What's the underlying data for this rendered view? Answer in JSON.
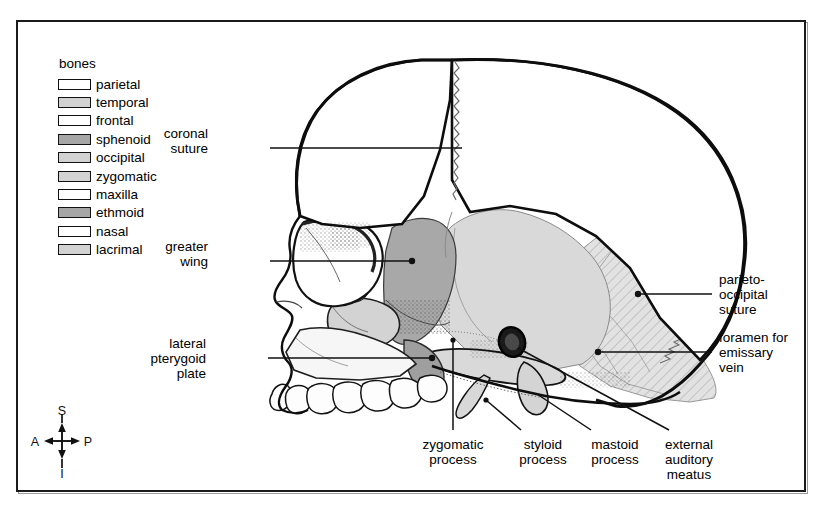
{
  "figure": {
    "frame": {
      "border_color": "#1b1b1b"
    }
  },
  "legend": {
    "title": "bones",
    "items": [
      {
        "label": "parietal",
        "fill": "#ffffff",
        "swatch": "white"
      },
      {
        "label": "temporal",
        "fill": "#d2d2d2",
        "swatch": "light"
      },
      {
        "label": "frontal",
        "fill": "#ffffff",
        "swatch": "white"
      },
      {
        "label": "sphenoid",
        "fill": "#a6a6a6",
        "swatch": "dark"
      },
      {
        "label": "occipital",
        "fill": "#d2d2d2",
        "swatch": "light"
      },
      {
        "label": "zygomatic",
        "fill": "#d2d2d2",
        "swatch": "light"
      },
      {
        "label": "maxilla",
        "fill": "#ffffff",
        "swatch": "white"
      },
      {
        "label": "ethmoid",
        "fill": "#a6a6a6",
        "swatch": "dark"
      },
      {
        "label": "nasal",
        "fill": "#ffffff",
        "swatch": "white"
      },
      {
        "label": "lacrimal",
        "fill": "#d2d2d2",
        "swatch": "light"
      }
    ]
  },
  "compass": {
    "superior": "S",
    "inferior": "I",
    "anterior": "A",
    "posterior": "P"
  },
  "callouts": {
    "coronal_suture": {
      "line1": "coronal",
      "line2": "suture",
      "line3": ""
    },
    "greater_wing": {
      "line1": "greater",
      "line2": "wing",
      "line3": ""
    },
    "lateral_pterygoid": {
      "line1": "lateral",
      "line2": "pterygoid",
      "line3": "plate"
    },
    "parieto_occipital": {
      "line1": "parieto-",
      "line2": "occipital",
      "line3": "suture"
    },
    "foramen_emissary": {
      "line1": "foramen for",
      "line2": "emissary",
      "line3": "vein"
    },
    "zygomatic_process": {
      "line1": "zygomatic",
      "line2": "process",
      "line3": ""
    },
    "styloid_process": {
      "line1": "styloid",
      "line2": "process",
      "line3": ""
    },
    "mastoid_process": {
      "line1": "mastoid",
      "line2": "process",
      "line3": ""
    },
    "external_meatus": {
      "line1": "external",
      "line2": "auditory",
      "line3": "meatus"
    }
  }
}
